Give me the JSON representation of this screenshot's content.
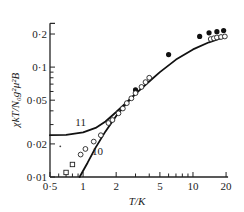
{
  "chart_data": {
    "type": "scatter",
    "title": "",
    "xlabel": "T/K",
    "ylabel": "χkT/N₀g²μ²B",
    "xscale": "log",
    "yscale": "log",
    "xlim": [
      0.5,
      20
    ],
    "ylim": [
      0.01,
      0.25
    ],
    "x_ticks": [
      0.5,
      1,
      2,
      5,
      10,
      20
    ],
    "x_tick_labels": [
      "0·5",
      "1",
      "2",
      "5",
      "10",
      "20"
    ],
    "y_ticks": [
      0.01,
      0.02,
      0.05,
      0.1,
      0.2
    ],
    "y_tick_labels": [
      "0·01",
      "0·02",
      "0·05",
      "0·1",
      "0·2"
    ],
    "grid": false,
    "legend": null,
    "series": [
      {
        "name": "filled circles",
        "marker": "filled-circle",
        "points": [
          [
            3.0,
            0.062
          ],
          [
            6.0,
            0.13
          ],
          [
            11.5,
            0.19
          ],
          [
            14,
            0.205
          ],
          [
            16.5,
            0.21
          ],
          [
            19,
            0.215
          ]
        ]
      },
      {
        "name": "open circles",
        "marker": "open-circle",
        "points": [
          [
            0.95,
            0.016
          ],
          [
            1.05,
            0.018
          ],
          [
            1.25,
            0.021
          ],
          [
            1.45,
            0.024
          ],
          [
            1.7,
            0.031
          ],
          [
            1.85,
            0.033
          ],
          [
            2.1,
            0.038
          ],
          [
            2.3,
            0.042
          ],
          [
            2.5,
            0.047
          ],
          [
            2.75,
            0.052
          ],
          [
            3.0,
            0.058
          ],
          [
            3.4,
            0.066
          ],
          [
            3.7,
            0.073
          ],
          [
            4.0,
            0.08
          ],
          [
            14.5,
            0.18
          ],
          [
            15.5,
            0.183
          ],
          [
            16.5,
            0.186
          ],
          [
            18,
            0.188
          ],
          [
            19.5,
            0.19
          ]
        ]
      },
      {
        "name": "open squares",
        "marker": "open-square",
        "points": [
          [
            0.7,
            0.011
          ],
          [
            0.8,
            0.013
          ]
        ]
      },
      {
        "name": "dot",
        "marker": "small-dot",
        "points": [
          [
            0.62,
            0.019
          ]
        ]
      }
    ],
    "curves": [
      {
        "name": "11",
        "label": "11",
        "points": [
          [
            0.5,
            0.024
          ],
          [
            0.7,
            0.0242
          ],
          [
            1.0,
            0.0255
          ],
          [
            1.3,
            0.028
          ],
          [
            1.6,
            0.032
          ],
          [
            2.0,
            0.039
          ],
          [
            2.5,
            0.048
          ],
          [
            3.0,
            0.057
          ],
          [
            4.0,
            0.074
          ],
          [
            5.0,
            0.09
          ],
          [
            7.0,
            0.117
          ],
          [
            10,
            0.145
          ],
          [
            14,
            0.168
          ],
          [
            20,
            0.19
          ]
        ]
      },
      {
        "name": "10",
        "label": "10",
        "points": [
          [
            0.93,
            0.01
          ],
          [
            1.1,
            0.0135
          ],
          [
            1.3,
            0.0185
          ],
          [
            1.6,
            0.026
          ],
          [
            2.0,
            0.036
          ],
          [
            2.5,
            0.047
          ],
          [
            3.0,
            0.057
          ]
        ]
      }
    ],
    "annotations": [
      {
        "text": "11",
        "x": 0.95,
        "y": 0.029
      },
      {
        "text": "10",
        "x": 1.35,
        "y": 0.016
      }
    ]
  }
}
